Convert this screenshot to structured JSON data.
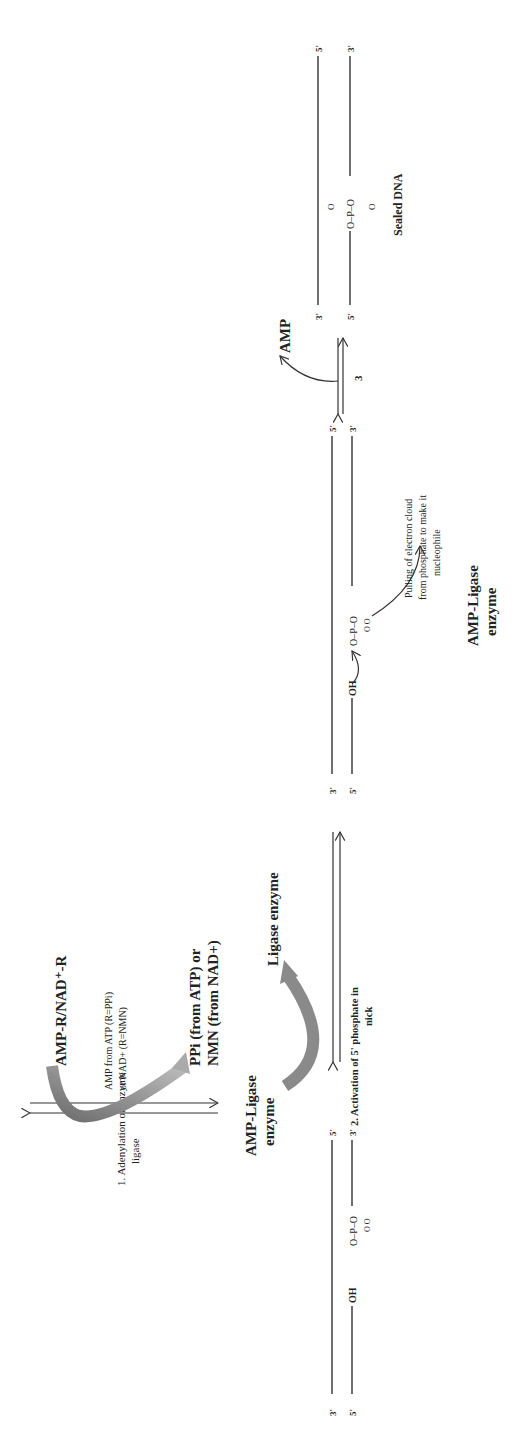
{
  "diagram": {
    "step1": {
      "label_line1": "1. Adenylation of enzyme",
      "label_line2": "ligase",
      "substrate": "AMP-R/NAD⁺-R",
      "note_line1": "AMP from ATP (R=PPi)",
      "note_line2": "or NAD+ (R=NMN)",
      "product_line1": "PPi (from ATP) or",
      "product_line2": "NMN (from NAD+)",
      "enzyme_line1": "AMP-Ligase",
      "enzyme_line2": "enzyme"
    },
    "step2": {
      "label_line1": "2. Activation of 5' phosphate in",
      "label_line2": "nick",
      "enzyme_out": "Ligase enzyme",
      "enzyme_in_line1": "AMP-Ligase",
      "enzyme_in_line2": "enzyme"
    },
    "intermediate": {
      "pull_line1": "Pulling of electron cloud",
      "pull_line2": "from phosphate to make it",
      "pull_line3": "nucleophile",
      "enzyme_line1": "AMP-Ligase",
      "enzyme_line2": "enzyme",
      "oh": "OH",
      "o": "O"
    },
    "step3": {
      "label": "3",
      "release": "AMP"
    },
    "product": {
      "label": "Sealed DNA",
      "phosphate": "O–P–O"
    },
    "ends": {
      "three_prime": "3'",
      "five_prime": "5'"
    }
  }
}
